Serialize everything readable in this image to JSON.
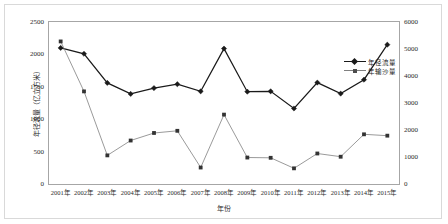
{
  "chart_data": {
    "type": "line",
    "title": "",
    "xlabel": "年份",
    "categories": [
      "2001年",
      "2002年",
      "2003年",
      "2004年",
      "2005年",
      "2006年",
      "2007年",
      "2008年",
      "2009年",
      "2010年",
      "2011年",
      "2012年",
      "2013年",
      "2014年",
      "2015年"
    ],
    "grid": false,
    "legend_position": "inside-right",
    "axes": {
      "left": {
        "label": "年径流量（亿立方米）",
        "ticks": [
          "0",
          "500",
          "1000",
          "1500",
          "2000",
          "2500"
        ],
        "min": 0,
        "max": 2500,
        "step": 500
      },
      "right": {
        "label": "年输沙量（万吨）",
        "ticks": [
          "0",
          "1000",
          "2000",
          "3000",
          "4000",
          "5000",
          "6000"
        ],
        "min": 0,
        "max": 6000,
        "step": 1000
      }
    },
    "series": [
      {
        "name": "年径流量",
        "axis": "left",
        "marker": "diamond",
        "color": "#1a1a1a",
        "values": [
          2100,
          2010,
          1560,
          1390,
          1480,
          1540,
          1430,
          2090,
          1425,
          1430,
          1165,
          1565,
          1395,
          1610,
          2150
        ]
      },
      {
        "name": "年输沙量",
        "axis": "right",
        "marker": "square",
        "color": "#808080",
        "values": [
          5280,
          3430,
          1060,
          1610,
          1890,
          1970,
          610,
          2570,
          980,
          970,
          580,
          1130,
          1010,
          1840,
          1790
        ]
      }
    ]
  },
  "legend": {
    "items": [
      {
        "label": "年径流量"
      },
      {
        "label": "年输沙量"
      }
    ]
  }
}
